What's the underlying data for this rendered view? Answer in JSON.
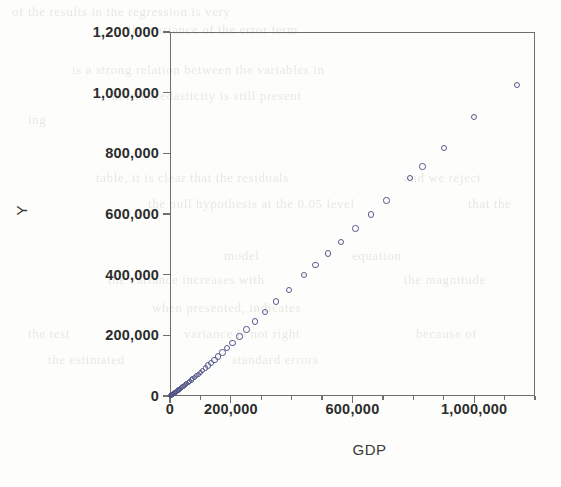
{
  "chart_data": {
    "type": "scatter",
    "title": "",
    "xlabel": "GDP",
    "ylabel": "Y",
    "xlim": [
      0,
      1200000
    ],
    "ylim": [
      0,
      1200000
    ],
    "grid": false,
    "legend": null,
    "marker": {
      "shape": "open-circle",
      "color": "#585a8e",
      "size": 6
    },
    "x_ticks": [
      {
        "value": 0,
        "label": "0",
        "major": true
      },
      {
        "value": 200000,
        "label": "200,000",
        "major": true
      },
      {
        "value": 400000,
        "label": "",
        "major": false
      },
      {
        "value": 600000,
        "label": "600,000",
        "major": true
      },
      {
        "value": 800000,
        "label": "",
        "major": false
      },
      {
        "value": 1000000,
        "label": "1,000,000",
        "major": true
      },
      {
        "value": 1200000,
        "label": "",
        "major": false
      }
    ],
    "y_ticks": [
      {
        "value": 0,
        "label": "0",
        "major": true
      },
      {
        "value": 200000,
        "label": "200,000",
        "major": true
      },
      {
        "value": 400000,
        "label": "400,000",
        "major": true
      },
      {
        "value": 600000,
        "label": "600,000",
        "major": true
      },
      {
        "value": 800000,
        "label": "800,000",
        "major": true
      },
      {
        "value": 1000000,
        "label": "1,000,000",
        "major": true
      },
      {
        "value": 1200000,
        "label": "1,200,000",
        "major": true
      }
    ],
    "points": [
      {
        "x": 2000,
        "y": 1500
      },
      {
        "x": 4000,
        "y": 3000
      },
      {
        "x": 6500,
        "y": 4500
      },
      {
        "x": 9000,
        "y": 6000
      },
      {
        "x": 12000,
        "y": 8000
      },
      {
        "x": 15000,
        "y": 10000
      },
      {
        "x": 18000,
        "y": 12000
      },
      {
        "x": 21000,
        "y": 14500
      },
      {
        "x": 24000,
        "y": 17000
      },
      {
        "x": 27500,
        "y": 19500
      },
      {
        "x": 31000,
        "y": 22000
      },
      {
        "x": 35000,
        "y": 25000
      },
      {
        "x": 39000,
        "y": 28000
      },
      {
        "x": 43000,
        "y": 31000
      },
      {
        "x": 47000,
        "y": 34500
      },
      {
        "x": 51000,
        "y": 38000
      },
      {
        "x": 55500,
        "y": 41500
      },
      {
        "x": 60000,
        "y": 45000
      },
      {
        "x": 65000,
        "y": 49000
      },
      {
        "x": 70000,
        "y": 53000
      },
      {
        "x": 75000,
        "y": 57500
      },
      {
        "x": 81000,
        "y": 62000
      },
      {
        "x": 87000,
        "y": 67000
      },
      {
        "x": 93000,
        "y": 72000
      },
      {
        "x": 100000,
        "y": 78000
      },
      {
        "x": 108000,
        "y": 85000
      },
      {
        "x": 116000,
        "y": 92000
      },
      {
        "x": 125000,
        "y": 100000
      },
      {
        "x": 135000,
        "y": 109000
      },
      {
        "x": 146000,
        "y": 119000
      },
      {
        "x": 158000,
        "y": 130000
      },
      {
        "x": 172000,
        "y": 143000
      },
      {
        "x": 188000,
        "y": 158000
      },
      {
        "x": 206000,
        "y": 175000
      },
      {
        "x": 228000,
        "y": 196000
      },
      {
        "x": 252000,
        "y": 219000
      },
      {
        "x": 280000,
        "y": 246000
      },
      {
        "x": 312000,
        "y": 277000
      },
      {
        "x": 348000,
        "y": 312000
      },
      {
        "x": 392000,
        "y": 350000
      },
      {
        "x": 440000,
        "y": 398000
      },
      {
        "x": 478000,
        "y": 432000
      },
      {
        "x": 520000,
        "y": 470000
      },
      {
        "x": 562000,
        "y": 508000
      },
      {
        "x": 610000,
        "y": 552000
      },
      {
        "x": 660000,
        "y": 598000
      },
      {
        "x": 712000,
        "y": 645000
      },
      {
        "x": 790000,
        "y": 718000
      },
      {
        "x": 830000,
        "y": 757000
      },
      {
        "x": 900000,
        "y": 818000
      },
      {
        "x": 1000000,
        "y": 920000
      },
      {
        "x": 1140000,
        "y": 1025000
      }
    ]
  },
  "background_ghost_text": [
    {
      "text": "of the results in the regression is very",
      "x": 12,
      "y": 4
    },
    {
      "text": "the variance of the error term",
      "x": 128,
      "y": 22
    },
    {
      "text": "is a strong relation between the variables in",
      "x": 72,
      "y": 62
    },
    {
      "text": "heteroscedasticity is still present",
      "x": 112,
      "y": 88
    },
    {
      "text": "ing",
      "x": 28,
      "y": 112
    },
    {
      "text": "table, it is clear that the residuals",
      "x": 96,
      "y": 170
    },
    {
      "text": "and we reject",
      "x": 404,
      "y": 170
    },
    {
      "text": "the null hypothesis at the 0.05 level",
      "x": 148,
      "y": 196
    },
    {
      "text": "that the",
      "x": 468,
      "y": 196
    },
    {
      "text": "model",
      "x": 224,
      "y": 248
    },
    {
      "text": "equation",
      "x": 352,
      "y": 248
    },
    {
      "text": "the variance increases with",
      "x": 108,
      "y": 272
    },
    {
      "text": "the magnitude",
      "x": 404,
      "y": 272
    },
    {
      "text": "when presented, indicates",
      "x": 152,
      "y": 300
    },
    {
      "text": "the test",
      "x": 28,
      "y": 326
    },
    {
      "text": "variance is not right",
      "x": 184,
      "y": 326
    },
    {
      "text": "because of",
      "x": 416,
      "y": 326
    },
    {
      "text": "the estimated",
      "x": 48,
      "y": 352
    },
    {
      "text": "standard errors",
      "x": 232,
      "y": 352
    }
  ]
}
